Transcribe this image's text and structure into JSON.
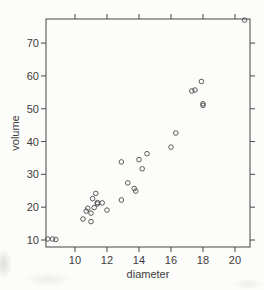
{
  "figure": {
    "background": "#fcfcfa"
  },
  "chart_data": {
    "type": "scatter",
    "title": "",
    "xlabel": "diameter",
    "ylabel": "volume",
    "xlim": [
      8.19,
      20.94
    ],
    "ylim": [
      7.87,
      77.33
    ],
    "x_ticks": [
      10,
      12,
      14,
      16,
      18,
      20
    ],
    "y_ticks": [
      10,
      20,
      30,
      40,
      50,
      60,
      70
    ],
    "grid": false,
    "legend": null,
    "marker": "open-circle",
    "ticks_mirrored_top_right": true,
    "colors": {
      "axis": "#555555",
      "text": "#3c3c3c",
      "marker": "#4a4a4a"
    },
    "points": [
      [
        8.3,
        10.3
      ],
      [
        8.6,
        10.3
      ],
      [
        8.8,
        10.2
      ],
      [
        10.5,
        16.4
      ],
      [
        10.7,
        18.8
      ],
      [
        10.8,
        19.7
      ],
      [
        11.0,
        15.6
      ],
      [
        11.0,
        18.2
      ],
      [
        11.1,
        22.6
      ],
      [
        11.2,
        19.9
      ],
      [
        11.3,
        24.2
      ],
      [
        11.4,
        21.0
      ],
      [
        11.4,
        21.4
      ],
      [
        11.7,
        21.3
      ],
      [
        12.0,
        19.1
      ],
      [
        12.9,
        22.2
      ],
      [
        12.9,
        33.8
      ],
      [
        13.3,
        27.4
      ],
      [
        13.7,
        25.7
      ],
      [
        13.8,
        24.9
      ],
      [
        14.0,
        34.5
      ],
      [
        14.2,
        31.7
      ],
      [
        14.5,
        36.3
      ],
      [
        16.0,
        38.3
      ],
      [
        16.3,
        42.6
      ],
      [
        17.3,
        55.4
      ],
      [
        17.5,
        55.7
      ],
      [
        17.9,
        58.3
      ],
      [
        18.0,
        51.5
      ],
      [
        18.0,
        51.0
      ],
      [
        20.6,
        77.0
      ]
    ]
  }
}
